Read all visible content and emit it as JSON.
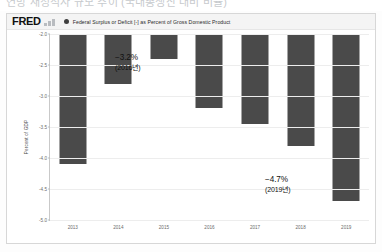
{
  "top_caption": "연방 재정적자 규모 추이 (국내총생산 대비 비율)",
  "chart": {
    "brand": "FRED",
    "brand_mark_icon": "fred-bars-icon",
    "legend": {
      "marker_icon": "legend-dot-icon",
      "label": "Federal Surplus or Deficit [-] as Percent of Gross Domestic Product"
    },
    "y_axis_title": "Percent of GDP"
  },
  "chart_data": {
    "type": "bar",
    "title": "Federal Surplus or Deficit [-] as Percent of Gross Domestic Product",
    "xlabel": "",
    "ylabel": "Percent of GDP",
    "categories": [
      "2013",
      "2014",
      "2015",
      "2016",
      "2017",
      "2018",
      "2019"
    ],
    "values": [
      -4.1,
      -2.8,
      -2.4,
      -3.2,
      -3.45,
      -3.8,
      -4.7
    ],
    "ylim": [
      -5.0,
      -2.0
    ],
    "yticks": [
      "-2.0",
      "-2.5",
      "-3.0",
      "-3.5",
      "-4.0",
      "-4.5",
      "-5.0"
    ],
    "ytick_values": [
      -2.0,
      -2.5,
      -3.0,
      -3.5,
      -4.0,
      -4.5,
      -5.0
    ],
    "grid": true,
    "legend_position": "top",
    "bar_color": "#4a4a4a",
    "annotations": [
      {
        "id": "2016",
        "value": "−3.2%",
        "year": "(2016년)"
      },
      {
        "id": "2019",
        "value": "−4.7%",
        "year": "(2019년)"
      }
    ]
  }
}
